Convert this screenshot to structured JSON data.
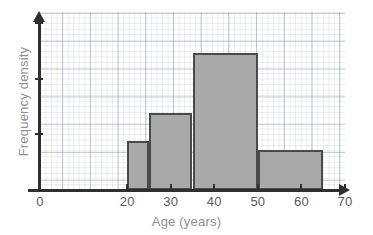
{
  "chart_data": {
    "type": "bar",
    "title": "",
    "subtitle": "",
    "xlabel": "Age (years)",
    "ylabel": "Frequency density",
    "xlim": [
      0,
      70
    ],
    "ylim": [
      0,
      3.2
    ],
    "grid": true,
    "legend": false,
    "legend_position": "none",
    "x_ticks": [
      {
        "value": 0,
        "label": "0"
      },
      {
        "value": 20,
        "label": "20"
      },
      {
        "value": 30,
        "label": "30"
      },
      {
        "value": 40,
        "label": "40"
      },
      {
        "value": 50,
        "label": "50"
      },
      {
        "value": 60,
        "label": "60"
      },
      {
        "value": 70,
        "label": "70"
      }
    ],
    "y_ticks": [
      {
        "value": 1,
        "label": ""
      },
      {
        "value": 2,
        "label": ""
      },
      {
        "value": 3,
        "label": ""
      }
    ],
    "bin_edges": [
      20,
      25,
      35,
      50,
      65
    ],
    "categories": [
      "20-25",
      "25-35",
      "35-50",
      "50-65"
    ],
    "values": [
      0.88,
      1.38,
      2.46,
      0.72
    ],
    "bars": [
      {
        "label": "20-25",
        "x_start": 20,
        "x_end": 25,
        "frequency_density": 0.88
      },
      {
        "label": "25-35",
        "x_start": 25,
        "x_end": 35,
        "frequency_density": 1.38
      },
      {
        "label": "35-50",
        "x_start": 35,
        "x_end": 50,
        "frequency_density": 2.46
      },
      {
        "label": "50-65",
        "x_start": 50,
        "x_end": 65,
        "frequency_density": 0.72
      }
    ],
    "colors": {
      "bar_fill": "#a9a9a9",
      "bar_stroke": "#4a4a4a",
      "axis": "#2f2f2f",
      "grid_minor": "#c3cbdd",
      "grid_major": "#8e9bb5",
      "tick_label": "#5b5b5b",
      "axis_title": "#8e8e8e",
      "background": "#ffffff"
    }
  }
}
